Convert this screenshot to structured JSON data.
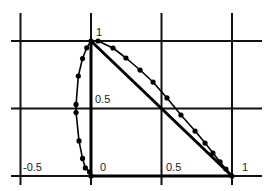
{
  "chart_data": {
    "type": "line",
    "title": "",
    "xlabel": "",
    "ylabel": "",
    "xlim": [
      -0.5,
      1.0
    ],
    "ylim": [
      0.0,
      1.0
    ],
    "grid": true,
    "x_gridlines": [
      -0.5,
      0,
      0.5,
      1
    ],
    "y_gridlines": [
      0,
      0.5,
      1
    ],
    "tick_labels": [
      {
        "text": "1",
        "x": 0.0,
        "y": 1.0
      },
      {
        "text": "0.5",
        "x": 0.0,
        "y": 0.5
      },
      {
        "text": "-0.5",
        "x": -0.5,
        "y": 0.0
      },
      {
        "text": "0",
        "x": 0.0,
        "y": 0.0
      },
      {
        "text": "0.5",
        "x": 0.5,
        "y": 0.0
      },
      {
        "text": "1",
        "x": 1.0,
        "y": 0.0
      }
    ],
    "series": [
      {
        "name": "triangle-edges",
        "style": "solid-thick",
        "points": [
          [
            0,
            0
          ],
          [
            0,
            1
          ],
          [
            1,
            0
          ],
          [
            0,
            0
          ]
        ]
      },
      {
        "name": "curve-left",
        "style": "line-with-markers",
        "points": [
          [
            0.0,
            0.0
          ],
          [
            -0.01,
            0.03
          ],
          [
            -0.04,
            0.06
          ],
          [
            -0.06,
            0.13
          ],
          [
            -0.085,
            0.26
          ],
          [
            -0.106,
            0.47
          ],
          [
            -0.106,
            0.53
          ],
          [
            -0.09,
            0.74
          ],
          [
            -0.06,
            0.87
          ],
          [
            -0.03,
            0.95
          ],
          [
            0.0,
            1.0
          ]
        ]
      },
      {
        "name": "curve-upper",
        "style": "line-with-markers",
        "points": [
          [
            0.05,
            1.0
          ],
          [
            0.156,
            0.948
          ],
          [
            0.248,
            0.874
          ],
          [
            0.348,
            0.785
          ],
          [
            0.44,
            0.696
          ],
          [
            0.539,
            0.578
          ],
          [
            0.638,
            0.452
          ],
          [
            0.738,
            0.333
          ],
          [
            0.809,
            0.244
          ],
          [
            0.865,
            0.17
          ],
          [
            0.915,
            0.104
          ],
          [
            0.957,
            0.052
          ],
          [
            1.0,
            0.0
          ]
        ]
      }
    ]
  },
  "labels": {
    "y_one": "1",
    "y_half": "0.5",
    "x_neg_half": "-0.5",
    "x_zero": "0",
    "x_half": "0.5",
    "x_one": "1"
  }
}
